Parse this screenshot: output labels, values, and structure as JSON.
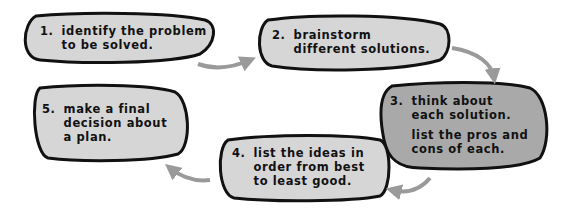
{
  "diagram": {
    "type": "cycle-flow",
    "colors": {
      "bubble_light": "#d6d6d6",
      "bubble_dark": "#a9a9a9",
      "outline": "#111111",
      "arrow": "#9a9a9a",
      "text": "#111111"
    },
    "steps": [
      {
        "number": "1.",
        "lines": [
          "Identify the problem",
          "to be solved."
        ]
      },
      {
        "number": "2.",
        "lines": [
          "Brainstorm",
          "different solutions."
        ]
      },
      {
        "number": "3.",
        "lines": [
          "Think about",
          "each solution."
        ],
        "lines2": [
          "List the pros and",
          "cons of each."
        ]
      },
      {
        "number": "4.",
        "lines": [
          "List the ideas in",
          "order from best",
          "to least good."
        ]
      },
      {
        "number": "5.",
        "lines": [
          "Make a final",
          "decision about",
          "a plan."
        ]
      }
    ],
    "arrows": [
      {
        "from": 1,
        "to": 2
      },
      {
        "from": 2,
        "to": 3
      },
      {
        "from": 3,
        "to": 4
      },
      {
        "from": 4,
        "to": 5
      }
    ]
  }
}
